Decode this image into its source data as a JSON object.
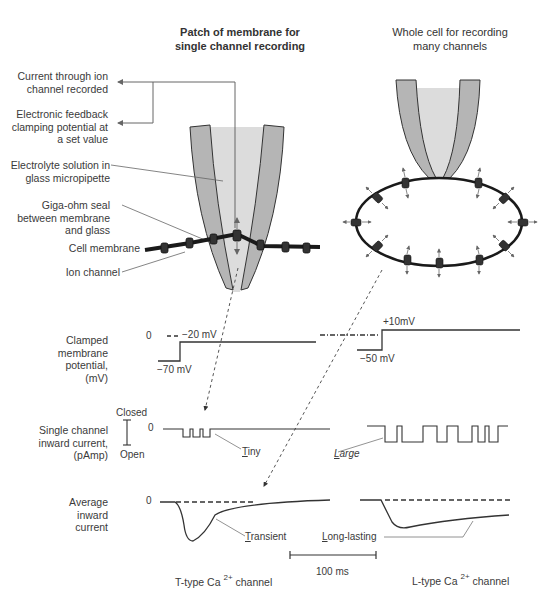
{
  "titles": {
    "left": "Patch of membrane for single channel recording",
    "left_line1": "Patch of membrane for",
    "left_line2": "single channel recording",
    "right_line1": "Whole cell for recording",
    "right_line2": "many channels"
  },
  "labels": {
    "current_recorded_1": "Current through ion",
    "current_recorded_2": "channel recorded",
    "feedback_1": "Electronic feedback",
    "feedback_2": "clamping potential at",
    "feedback_3": "a set value",
    "electrolyte_1": "Electrolyte solution in",
    "electrolyte_2": "glass micropipette",
    "seal_1": "Giga-ohm seal",
    "seal_2": "between membrane",
    "seal_3": "and glass",
    "cell_membrane": "Cell membrane",
    "ion_channel": "Ion channel"
  },
  "traces": {
    "clamped": {
      "label_1": "Clamped",
      "label_2": "membrane",
      "label_3": "potential,",
      "label_4": "(mV)",
      "zero": "0",
      "t_hold": "−70 mV",
      "t_step": "−20 mV",
      "l_hold": "−50 mV",
      "l_step": "+10mV"
    },
    "single": {
      "label_1": "Single channel",
      "label_2": "inward current,",
      "label_3": "(pAmp)",
      "closed": "Closed",
      "open": "Open",
      "zero": "0",
      "tiny_initial": "T",
      "tiny_rest": "iny",
      "large_initial": "L",
      "large_rest": "arge"
    },
    "average": {
      "label_1": "Average",
      "label_2": "inward",
      "label_3": "current",
      "zero": "0",
      "transient_initial": "T",
      "transient_rest": "ransient",
      "long_initial": "L",
      "long_rest": "ong-lasting"
    }
  },
  "scale_bar": "100 ms",
  "channels": {
    "t_type": "T-type Ca",
    "l_type": "L-type Ca",
    "charge": "2+",
    "suffix": "channel"
  },
  "colors": {
    "line": "#333333",
    "glass": "#b5b5b5",
    "solution": "#dcdcdc",
    "arrow_gray": "#777777"
  }
}
